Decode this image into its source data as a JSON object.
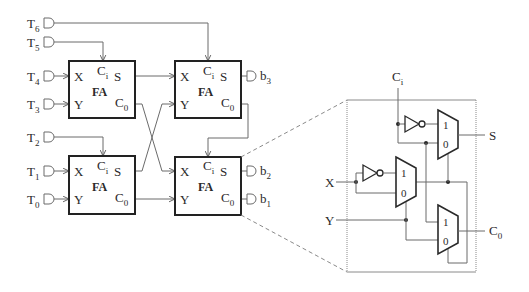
{
  "inputs": [
    {
      "main": "T",
      "sub": "6"
    },
    {
      "main": "T",
      "sub": "5"
    },
    {
      "main": "T",
      "sub": "4"
    },
    {
      "main": "T",
      "sub": "3"
    },
    {
      "main": "T",
      "sub": "2"
    },
    {
      "main": "T",
      "sub": "1"
    },
    {
      "main": "T",
      "sub": "0"
    }
  ],
  "outputs": [
    {
      "main": "b",
      "sub": "3"
    },
    {
      "main": "b",
      "sub": "2"
    },
    {
      "main": "b",
      "sub": "1"
    }
  ],
  "full_adders": [
    {
      "title": "FA",
      "x": "X",
      "y": "Y",
      "ci": {
        "main": "C",
        "sub": "i"
      },
      "s": "S",
      "co": {
        "main": "C",
        "sub": "0"
      }
    },
    {
      "title": "FA",
      "x": "X",
      "y": "Y",
      "ci": {
        "main": "C",
        "sub": "i"
      },
      "s": "S",
      "co": {
        "main": "C",
        "sub": "0"
      }
    },
    {
      "title": "FA",
      "x": "X",
      "y": "Y",
      "ci": {
        "main": "C",
        "sub": "i"
      },
      "s": "S",
      "co": {
        "main": "C",
        "sub": "0"
      }
    },
    {
      "title": "FA",
      "x": "X",
      "y": "Y",
      "ci": {
        "main": "C",
        "sub": "i"
      },
      "s": "S",
      "co": {
        "main": "C",
        "sub": "0"
      }
    }
  ],
  "detail": {
    "ci": {
      "main": "C",
      "sub": "i"
    },
    "x": "X",
    "y": "Y",
    "s": "S",
    "co": {
      "main": "C",
      "sub": "0"
    },
    "muxes": [
      {
        "in1": "1",
        "in0": "0"
      },
      {
        "in1": "1",
        "in0": "0"
      },
      {
        "in1": "1",
        "in0": "0"
      }
    ]
  },
  "colors": {
    "wire": "#6b6b6b",
    "box": "#222222",
    "text": "#2a2a2a",
    "dashed": "#8a8a8a",
    "background": "#ffffff"
  }
}
